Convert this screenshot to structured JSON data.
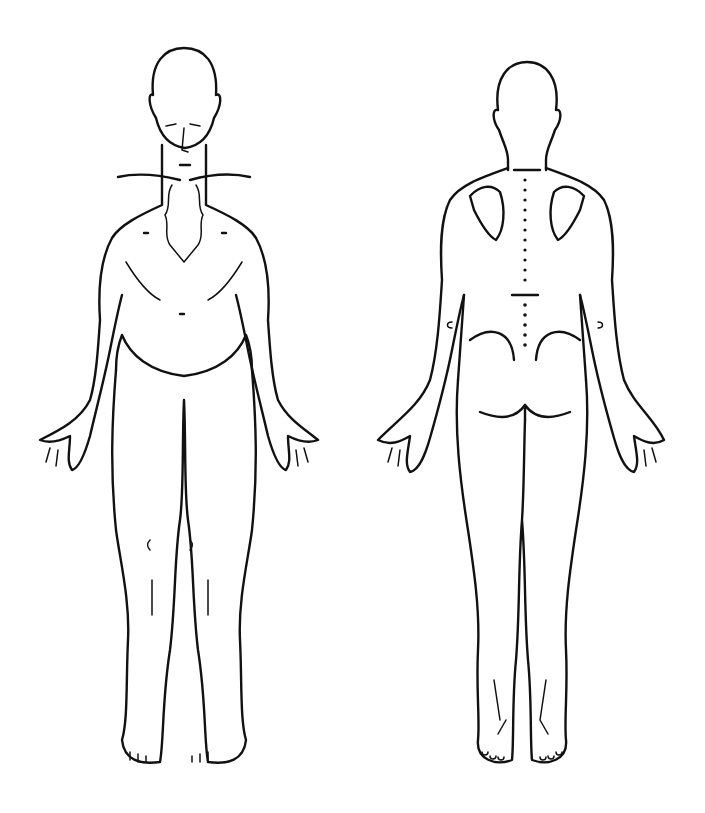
{
  "diagram": {
    "type": "body-outline-chart",
    "background": "#ffffff",
    "line_color": "#111111",
    "figures": [
      {
        "id": "front",
        "view": "anterior",
        "description": "Front view of standing human figure, arms at sides, palms forward"
      },
      {
        "id": "back",
        "view": "posterior",
        "description": "Back view of standing human figure with dotted spine line and scapulae"
      }
    ],
    "text_labels": []
  }
}
